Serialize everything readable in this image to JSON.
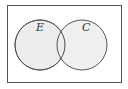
{
  "diagram": {
    "type": "venn",
    "universe": {
      "x": 7,
      "y": 5,
      "width": 115,
      "height": 78,
      "stroke": "#555555",
      "fill": "#ffffff"
    },
    "sets": [
      {
        "label": "E",
        "cx": 40,
        "cy": 45,
        "r": 25,
        "fill": "#ececec",
        "stroke": "#555555"
      },
      {
        "label": "C",
        "cx": 82,
        "cy": 45,
        "r": 25,
        "fill": "#ececec",
        "stroke": "#555555"
      }
    ]
  }
}
